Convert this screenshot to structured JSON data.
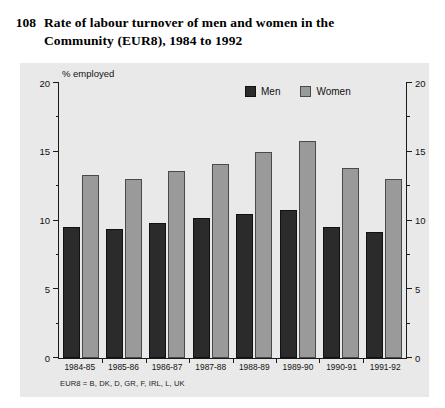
{
  "figure": {
    "number": "108",
    "title": "Rate of labour turnover of men and women in the Community (EUR8), 1984 to 1992"
  },
  "footnote": "EUR8 = B, DK, D, GR, F, IRL, L, UK",
  "legend": {
    "men_label": "Men",
    "women_label": "Women"
  },
  "colors": {
    "men": "#2b2b2b",
    "women": "#9a9a9a",
    "panel": "#e9e9e9",
    "axis": "#1a1a1a",
    "page": "#ffffff"
  },
  "chart_data": {
    "type": "bar",
    "title": "Rate of labour turnover of men and women in the Community (EUR8), 1984 to 1992",
    "xlabel": "",
    "ylabel": "% employed",
    "ylim": [
      0,
      20
    ],
    "yticks": [
      0,
      5,
      10,
      15,
      20
    ],
    "ytick_labels": [
      "0",
      "5",
      "10",
      "15",
      "20"
    ],
    "yminor_ticks": [
      2.5,
      7.5,
      12.5,
      17.5
    ],
    "grid": false,
    "legend_position": "top-right-inside",
    "dual_axis": true,
    "categories": [
      "1984-85",
      "1985-86",
      "1986-87",
      "1987-88",
      "1988-89",
      "1989-90",
      "1990-91",
      "1991-92"
    ],
    "series": [
      {
        "name": "Men",
        "color": "#2b2b2b",
        "values": [
          9.5,
          9.4,
          9.8,
          10.2,
          10.5,
          10.8,
          9.5,
          9.2
        ]
      },
      {
        "name": "Women",
        "color": "#9a9a9a",
        "values": [
          13.3,
          13.0,
          13.6,
          14.1,
          15.0,
          15.8,
          13.8,
          13.0
        ]
      }
    ]
  }
}
